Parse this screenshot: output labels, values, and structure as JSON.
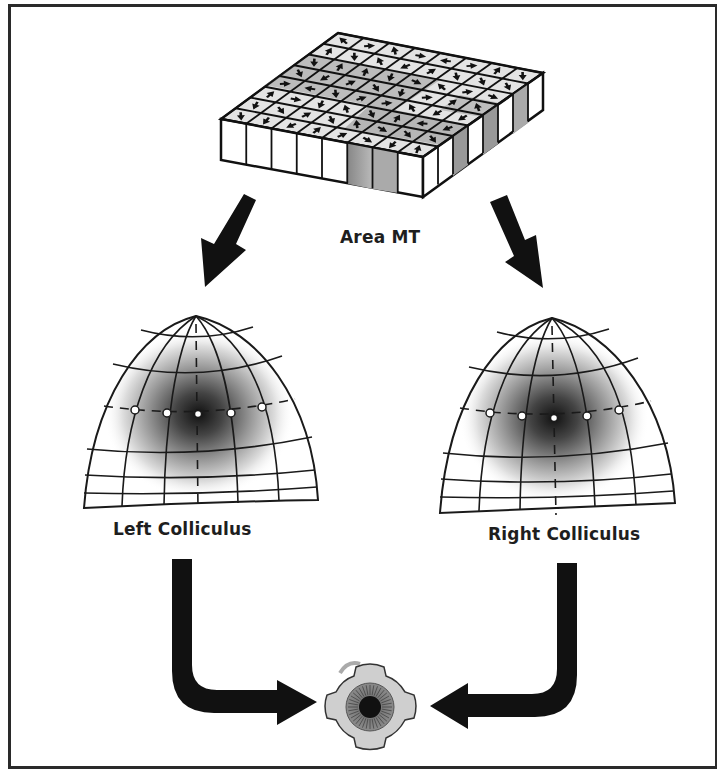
{
  "figure": {
    "labels": {
      "area_mt": "Area MT",
      "left_colliculus": "Left Colliculus",
      "right_colliculus": "Right Colliculus"
    },
    "nodes": [
      {
        "id": "area_mt",
        "shape": "3d-grid-block",
        "grid": "8x8",
        "content": "direction-arrow cells with grey shading"
      },
      {
        "id": "left_colliculus",
        "shape": "dome-map",
        "markers": 5,
        "hotspot": "center gaussian"
      },
      {
        "id": "right_colliculus",
        "shape": "dome-map",
        "markers": 5,
        "hotspot": "center gaussian"
      },
      {
        "id": "eye",
        "shape": "eyeball-icon"
      }
    ],
    "edges": [
      {
        "from": "area_mt",
        "to": "left_colliculus",
        "style": "thick-black-arrow"
      },
      {
        "from": "area_mt",
        "to": "right_colliculus",
        "style": "thick-black-arrow"
      },
      {
        "from": "left_colliculus",
        "to": "eye",
        "style": "L-shaped-black-arrow"
      },
      {
        "from": "right_colliculus",
        "to": "eye",
        "style": "L-shaped-black-arrow"
      }
    ],
    "colors": {
      "ink": "#111111",
      "frame": "#2a2a2a",
      "shade": "#777777",
      "background": "#ffffff"
    }
  }
}
